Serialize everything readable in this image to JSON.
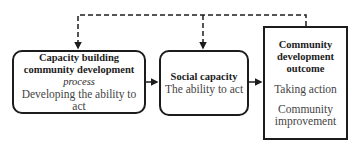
{
  "diagram": {
    "nodes": [
      {
        "id": "capacity-building",
        "title_line1": "Capacity building",
        "title_line2": "community development",
        "title_line3": "process",
        "subtitle": "Developing the ability to act"
      },
      {
        "id": "social-capacity",
        "title": "Social capacity",
        "subtitle": "The ability to act"
      },
      {
        "id": "outcome",
        "title_line1": "Community",
        "title_line2": "development",
        "title_line3": "outcome",
        "item1": "Taking action",
        "item2_line1": "Community",
        "item2_line2": "improvement"
      }
    ],
    "edges": [
      {
        "from": "capacity-building",
        "to": "social-capacity",
        "style": "solid"
      },
      {
        "from": "social-capacity",
        "to": "outcome",
        "style": "solid"
      },
      {
        "from": "outcome",
        "to": "capacity-building",
        "style": "dashed",
        "feedback": true
      },
      {
        "from": "outcome",
        "to": "social-capacity",
        "style": "dashed",
        "feedback": true
      }
    ],
    "colors": {
      "stroke": "#1c1c1c",
      "text": "#2a2a2a",
      "background": "#ffffff"
    }
  }
}
